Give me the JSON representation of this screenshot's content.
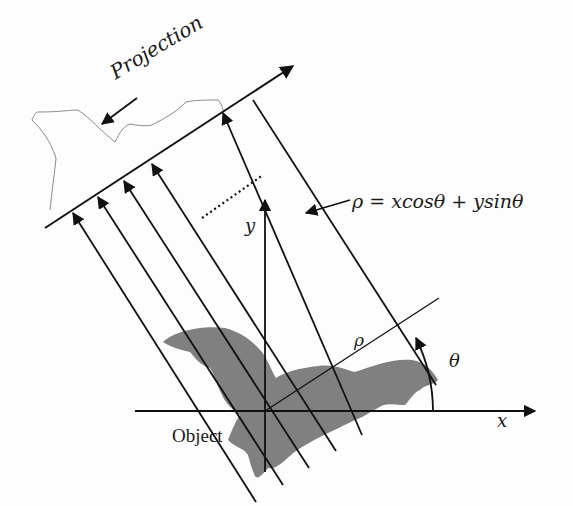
{
  "diagram": {
    "labels": {
      "projection": "Projection",
      "equation": "ρ = xcosθ + ysinθ",
      "x_axis": "x",
      "y_axis": "y",
      "rho": "ρ",
      "theta": "θ",
      "object": "Object"
    },
    "colors": {
      "line": "#111111",
      "object_fill": "#808080",
      "projection_outline": "#8a8a8a",
      "background": "#fdfdfd"
    },
    "geometry": {
      "origin": [
        265,
        411
      ],
      "projection_axis_angle_deg": 33,
      "ray_count_visible": 6
    }
  }
}
